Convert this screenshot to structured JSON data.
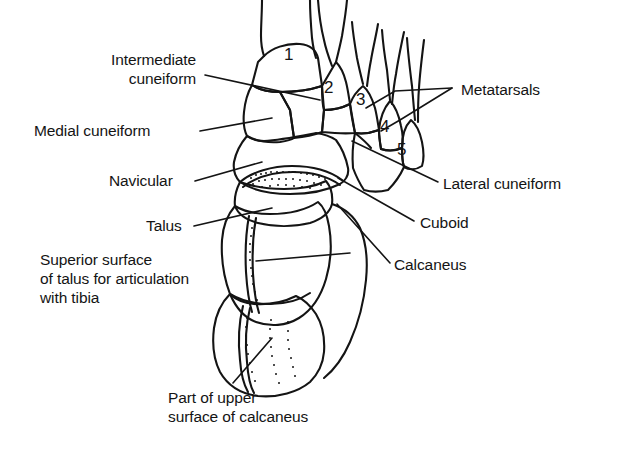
{
  "figure": {
    "background_color": "#ffffff",
    "line_color": "#141414",
    "labels": [
      {
        "id": "intermediate-cuneiform",
        "text": "Intermediate\ncuneiform",
        "line1": "Intermediate",
        "line2": "cuneiform",
        "x": 96,
        "y": 52,
        "align": "right"
      },
      {
        "id": "medial-cuneiform",
        "text": "Medial cuneiform",
        "line1": "Medial cuneiform",
        "line2": "",
        "x": 34,
        "y": 122,
        "align": "left"
      },
      {
        "id": "navicular",
        "text": "Navicular",
        "line1": "Navicular",
        "line2": "",
        "x": 109,
        "y": 170,
        "align": "left"
      },
      {
        "id": "talus",
        "text": "Talus",
        "line1": "Talus",
        "line2": "",
        "x": 146,
        "y": 215,
        "align": "left"
      },
      {
        "id": "superior-surface-of-talus",
        "text": "Superior surface\nof talus for articulation\nwith tibia",
        "line1": "Superior surface",
        "line2": "of talus for articulation",
        "line3": "with tibia",
        "x": 40,
        "y": 250,
        "align": "left"
      },
      {
        "id": "part-of-upper-surface-of-calcaneus",
        "text": "Part of upper\nsurface of calcaneus",
        "line1": "Part of upper",
        "line2": "surface of calcaneus",
        "x": 168,
        "y": 389,
        "align": "left"
      },
      {
        "id": "metatarsals",
        "text": "Metatarsals",
        "line1": "Metatarsals",
        "line2": "",
        "x": 460,
        "y": 84,
        "align": "left"
      },
      {
        "id": "lateral-cuneiform",
        "text": "Lateral cuneiform",
        "line1": "Lateral cuneiform",
        "line2": "",
        "x": 443,
        "y": 177,
        "align": "left"
      },
      {
        "id": "cuboid",
        "text": "Cuboid",
        "line1": "Cuboid",
        "line2": "",
        "x": 420,
        "y": 216,
        "align": "left"
      },
      {
        "id": "calcaneus",
        "text": "Calcaneus",
        "line1": "Calcaneus",
        "line2": "",
        "x": 394,
        "y": 259,
        "align": "left"
      }
    ],
    "metatarsal_numbers": [
      {
        "id": "metatarsal-1",
        "label": "1",
        "x": 284,
        "y": 52
      },
      {
        "id": "metatarsal-2",
        "label": "2",
        "x": 325,
        "y": 81
      },
      {
        "id": "metatarsal-3",
        "label": "3",
        "x": 357,
        "y": 93
      },
      {
        "id": "metatarsal-4",
        "label": "4",
        "x": 381,
        "y": 120
      },
      {
        "id": "metatarsal-5",
        "label": "5",
        "x": 398,
        "y": 143
      }
    ]
  }
}
